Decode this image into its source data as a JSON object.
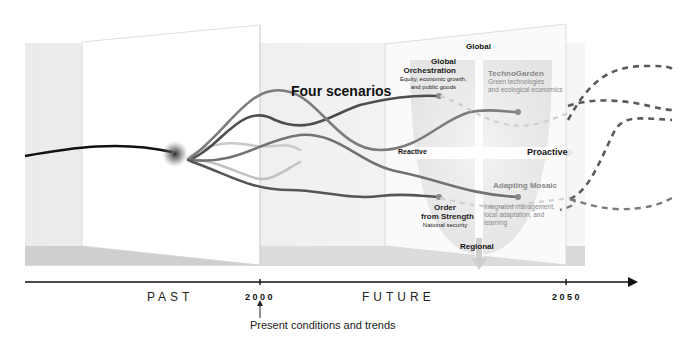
{
  "diagram": {
    "title": "Four scenarios",
    "timeline": {
      "past_label": "PAST",
      "future_label": "FUTURE",
      "year_start": "2000",
      "year_end": "2050",
      "present_note": "Present conditions and trends"
    },
    "quadrant_axes": {
      "top": "Global",
      "bottom": "Regional",
      "left": "Reactive",
      "right": "Proactive"
    },
    "scenarios": [
      {
        "name_line1": "Global",
        "name_line2": "Orchestration",
        "desc_line1": "Equity, economic growth,",
        "desc_line2": "and public goods",
        "quadrant": "global-reactive"
      },
      {
        "name_line1": "TechnoGarden",
        "name_line2": "",
        "desc_line1": "Green technologies",
        "desc_line2": "and ecological economics",
        "quadrant": "global-proactive"
      },
      {
        "name_line1": "Order",
        "name_line2": "from Strength",
        "desc_line1": "National security",
        "desc_line2": "",
        "quadrant": "regional-reactive"
      },
      {
        "name_line1": "Adapting Mosaic",
        "name_line2": "",
        "desc_line1": "Integrated management,",
        "desc_line2": "local adaptation, and",
        "desc_line3": "learning",
        "quadrant": "regional-proactive"
      }
    ],
    "colors": {
      "line_dark": "#4a4a4a",
      "line_mid": "#777777",
      "line_light": "#bdbdbd",
      "panel_shade": "#ececec",
      "axis": "#111111"
    }
  }
}
